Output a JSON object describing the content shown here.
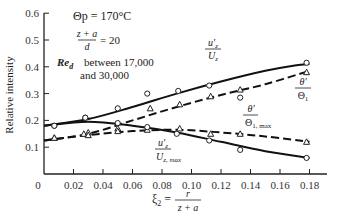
{
  "chart_data": {
    "type": "line",
    "title": "",
    "xlabel": "ξ2 = r / (z + a)",
    "ylabel": "Relative intensity",
    "xlim": [
      0,
      0.19
    ],
    "ylim": [
      0,
      0.6
    ],
    "x_ticks": [
      "0",
      "0.02",
      "0.04",
      "0.06",
      "0.08",
      "0.10",
      "0.12",
      "0.14",
      "0.16",
      "0.18"
    ],
    "y_ticks": [
      "0.1",
      "0.2",
      "0.3",
      "0.4",
      "0.5",
      "0.6"
    ],
    "grid": false,
    "annotations": {
      "theta_p": "Θp = 170°C",
      "ratio_num": "z + a",
      "ratio_den": "d",
      "ratio_val": "= 20",
      "re_label": "Red",
      "re_text1": "between 17,000",
      "re_text2": "and 30,000"
    },
    "series": [
      {
        "name": "u'z / Uz",
        "label_num": "u'z",
        "label_den": "Uz",
        "style": "solid",
        "marker": "circle",
        "points": [
          [
            0.007,
            0.18
          ],
          [
            0.028,
            0.21
          ],
          [
            0.05,
            0.245
          ],
          [
            0.07,
            0.3
          ],
          [
            0.091,
            0.31
          ],
          [
            0.112,
            0.33
          ],
          [
            0.133,
            0.285
          ],
          [
            0.178,
            0.415
          ]
        ],
        "curve": [
          [
            0.0,
            0.18
          ],
          [
            0.03,
            0.205
          ],
          [
            0.06,
            0.25
          ],
          [
            0.09,
            0.3
          ],
          [
            0.12,
            0.345
          ],
          [
            0.15,
            0.385
          ],
          [
            0.17,
            0.405
          ],
          [
            0.18,
            0.41
          ]
        ]
      },
      {
        "name": "θ' / Θ1",
        "label_num": "θ'",
        "label_den": "Θ1",
        "style": "dashed",
        "marker": "triangle",
        "points": [
          [
            0.007,
            0.135
          ],
          [
            0.027,
            0.15
          ],
          [
            0.03,
            0.155
          ],
          [
            0.05,
            0.17
          ],
          [
            0.072,
            0.245
          ],
          [
            0.092,
            0.26
          ],
          [
            0.113,
            0.29
          ],
          [
            0.133,
            0.315
          ],
          [
            0.178,
            0.38
          ]
        ],
        "curve": [
          [
            0.0,
            0.125
          ],
          [
            0.03,
            0.15
          ],
          [
            0.06,
            0.2
          ],
          [
            0.09,
            0.25
          ],
          [
            0.12,
            0.295
          ],
          [
            0.15,
            0.335
          ],
          [
            0.18,
            0.385
          ]
        ]
      },
      {
        "name": "θ' / Θ1,max",
        "label_num": "θ'",
        "label_den": "Θ1, max",
        "style": "dashed",
        "marker": "triangle",
        "points": [
          [
            0.007,
            0.135
          ],
          [
            0.03,
            0.145
          ],
          [
            0.05,
            0.16
          ],
          [
            0.07,
            0.165
          ],
          [
            0.092,
            0.17
          ],
          [
            0.113,
            0.15
          ],
          [
            0.133,
            0.15
          ],
          [
            0.178,
            0.12
          ]
        ],
        "curve": [
          [
            0.0,
            0.125
          ],
          [
            0.03,
            0.145
          ],
          [
            0.06,
            0.16
          ],
          [
            0.09,
            0.165
          ],
          [
            0.12,
            0.155
          ],
          [
            0.15,
            0.14
          ],
          [
            0.18,
            0.12
          ]
        ]
      },
      {
        "name": "u'z / Uz,max",
        "label_num": "u'z",
        "label_den": "Uz, max",
        "style": "solid",
        "marker": "circle",
        "points": [
          [
            0.007,
            0.18
          ],
          [
            0.028,
            0.21
          ],
          [
            0.05,
            0.19
          ],
          [
            0.07,
            0.175
          ],
          [
            0.09,
            0.15
          ],
          [
            0.112,
            0.125
          ],
          [
            0.133,
            0.09
          ],
          [
            0.178,
            0.06
          ]
        ],
        "curve": [
          [
            0.0,
            0.18
          ],
          [
            0.03,
            0.195
          ],
          [
            0.06,
            0.18
          ],
          [
            0.09,
            0.155
          ],
          [
            0.12,
            0.12
          ],
          [
            0.15,
            0.085
          ],
          [
            0.18,
            0.06
          ]
        ]
      }
    ]
  }
}
